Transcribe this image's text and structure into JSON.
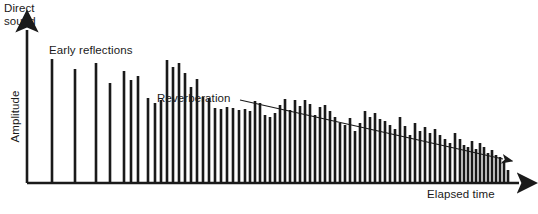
{
  "figure": {
    "title_text_present": false,
    "background_color": "#ffffff",
    "ink_color": "#1a1a1a"
  },
  "labels": {
    "direct_sound": "Direct\nsound",
    "early_reflections": "Early reflections",
    "reverberation": "Reverberation",
    "elapsed_time": "Elapsed time",
    "amplitude": "Amplitude"
  },
  "axes": {
    "x_axis_name": "Elapsed time",
    "y_axis_name": "Amplitude",
    "x_arrow": true,
    "y_arrow": true,
    "origin_px": [
      27,
      183
    ],
    "x_end_px": [
      528,
      183
    ],
    "y_end_px": [
      27,
      22
    ]
  },
  "annotations": {
    "decay_arrow": {
      "name": "reverberation-decay-arrow",
      "from_px": [
        240,
        100
      ],
      "to_px": [
        509,
        161
      ]
    }
  },
  "chart_data": {
    "type": "bar",
    "title": "",
    "xlabel": "Elapsed time",
    "ylabel": "Amplitude",
    "grid": false,
    "legend": null,
    "xlim": [
      0,
      538
    ],
    "ylim": [
      0,
      161
    ],
    "note": "Impulse response / reflectogram: direct sound arrow at origin, early discrete reflections, then dense decaying reverberation tail.",
    "x": [
      52,
      75,
      96,
      110,
      124,
      131,
      138,
      148,
      155,
      161,
      167,
      173,
      179,
      185,
      191,
      197,
      203,
      209,
      215,
      221,
      227,
      233,
      239,
      245,
      250,
      255,
      260,
      265,
      270,
      275,
      280,
      285,
      290,
      295,
      300,
      305,
      310,
      315,
      320,
      325,
      330,
      335,
      340,
      345,
      350,
      355,
      360,
      365,
      370,
      375,
      380,
      385,
      390,
      395,
      400,
      405,
      410,
      415,
      420,
      425,
      430,
      435,
      440,
      445,
      450,
      455,
      460,
      464,
      468,
      472,
      476,
      480,
      484,
      488,
      492,
      496,
      500,
      504,
      508
    ],
    "values": [
      124,
      114,
      120,
      100,
      112,
      103,
      107,
      85,
      80,
      83,
      123,
      116,
      120,
      110,
      96,
      104,
      86,
      85,
      75,
      74,
      76,
      75,
      73,
      74,
      72,
      82,
      80,
      68,
      66,
      70,
      78,
      84,
      73,
      83,
      77,
      83,
      79,
      68,
      76,
      78,
      72,
      66,
      60,
      58,
      65,
      52,
      60,
      72,
      66,
      70,
      64,
      62,
      58,
      54,
      66,
      57,
      48,
      60,
      52,
      56,
      50,
      54,
      48,
      44,
      40,
      50,
      44,
      38,
      36,
      42,
      34,
      40,
      36,
      30,
      33,
      28,
      26,
      22,
      13
    ],
    "bar_width_px": 2.6
  }
}
